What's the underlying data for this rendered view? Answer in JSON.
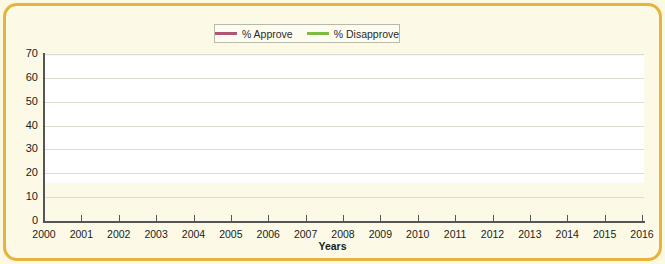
{
  "chart_data": {
    "type": "line",
    "title": "",
    "xlabel": "Years",
    "ylabel": "",
    "xlim": [
      2000,
      2016
    ],
    "ylim": [
      0,
      70
    ],
    "yticks": [
      0,
      10,
      20,
      30,
      40,
      50,
      60,
      70
    ],
    "grid": true,
    "legend_position": "top-center",
    "categories": [
      "2000",
      "2001",
      "2002",
      "2003",
      "2004",
      "2005",
      "2006",
      "2007",
      "2008",
      "2009",
      "2010",
      "2011",
      "2012",
      "2013",
      "2014",
      "2015",
      "2016"
    ],
    "series": [
      {
        "name": "% Approve",
        "color": "#b05574",
        "values": [
          62.5,
          59.0,
          60.5,
          60.0,
          53.0,
          51.0,
          61.0,
          59.0,
          49.0,
          61.0,
          53.0,
          47.0,
          49.0,
          44.0,
          45.0,
          45.0,
          45.0
        ],
        "points": [
          {
            "x": 2000.0,
            "y": 62.5
          },
          {
            "x": 2001.0,
            "y": 60.5
          },
          {
            "x": 2001.0,
            "y": 59.0
          },
          {
            "x": 2002.0,
            "y": 60.5
          },
          {
            "x": 2003.0,
            "y": 60.0
          },
          {
            "x": 2003.0,
            "y": 53.0
          },
          {
            "x": 2004.0,
            "y": 51.0
          },
          {
            "x": 2005.0,
            "y": 44.5
          },
          {
            "x": 2005.0,
            "y": 56.0
          },
          {
            "x": 2006.0,
            "y": 61.0
          },
          {
            "x": 2007.0,
            "y": 59.0
          },
          {
            "x": 2008.0,
            "y": 51.0
          },
          {
            "x": 2008.5,
            "y": 49.0
          },
          {
            "x": 2009.0,
            "y": 61.0
          },
          {
            "x": 2010.0,
            "y": 53.0
          },
          {
            "x": 2011.0,
            "y": 47.0
          },
          {
            "x": 2012.0,
            "y": 46.0
          },
          {
            "x": 2012.0,
            "y": 49.0
          },
          {
            "x": 2013.0,
            "y": 43.5
          },
          {
            "x": 2013.0,
            "y": 45.0
          },
          {
            "x": 2014.0,
            "y": 44.5
          },
          {
            "x": 2014.0,
            "y": 44.5
          },
          {
            "x": 2016.0,
            "y": 44.5
          }
        ]
      },
      {
        "name": "% Disapprove",
        "color": "#7fbb42",
        "values": [
          30.0,
          33.5,
          30.5,
          34.5,
          39.0,
          44.5,
          33.0,
          32.0,
          39.0,
          28.5,
          39.0,
          43.0,
          46.0,
          44.5,
          47.0,
          47.0,
          47.0
        ],
        "points": [
          {
            "x": 2000.0,
            "y": 30.0
          },
          {
            "x": 2001.0,
            "y": 33.5
          },
          {
            "x": 2001.0,
            "y": 27.5
          },
          {
            "x": 2002.0,
            "y": 30.5
          },
          {
            "x": 2003.0,
            "y": 34.5
          },
          {
            "x": 2003.0,
            "y": 39.5
          },
          {
            "x": 2004.0,
            "y": 41.5
          },
          {
            "x": 2005.0,
            "y": 45.5
          },
          {
            "x": 2005.0,
            "y": 33.5
          },
          {
            "x": 2006.0,
            "y": 33.0
          },
          {
            "x": 2007.0,
            "y": 32.0
          },
          {
            "x": 2008.0,
            "y": 39.0
          },
          {
            "x": 2008.4,
            "y": 38.5
          },
          {
            "x": 2009.0,
            "y": 28.5
          },
          {
            "x": 2010.0,
            "y": 39.0
          },
          {
            "x": 2011.0,
            "y": 41.0
          },
          {
            "x": 2012.0,
            "y": 45.5
          },
          {
            "x": 2012.0,
            "y": 40.5
          },
          {
            "x": 2013.0,
            "y": 46.0
          },
          {
            "x": 2013.3,
            "y": 44.0
          },
          {
            "x": 2014.0,
            "y": 47.0
          },
          {
            "x": 2016.0,
            "y": 47.0
          }
        ]
      }
    ]
  },
  "legend": {
    "items": [
      {
        "label": "% Approve",
        "color": "#b05574"
      },
      {
        "label": "% Disapprove",
        "color": "#7fbb42"
      }
    ]
  },
  "axes": {
    "x_title": "Years"
  }
}
